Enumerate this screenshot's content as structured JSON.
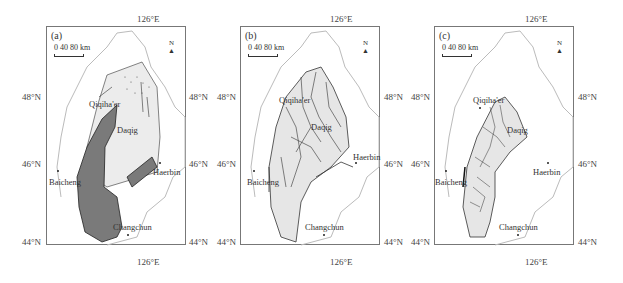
{
  "figure": {
    "panels": [
      {
        "id": "a",
        "label": "(a)"
      },
      {
        "id": "b",
        "label": "(b)"
      },
      {
        "id": "c",
        "label": "(c)"
      }
    ],
    "scale_label": "0  40  80 km",
    "north_label": "N",
    "axes": {
      "top_lon": "126°E",
      "bottom_lon": "126°E",
      "lat_48": "48°N",
      "lat_46": "46°N",
      "lat_44": "44°N"
    },
    "cities": {
      "a": {
        "qiqihaer": "Qiqiha'er",
        "daqing": "Daqig",
        "baicheng": "Baicheng",
        "haerbin": "Haerbin",
        "changchun": "Changchun"
      },
      "b": {
        "qiqihaer": "Qiqiha'er",
        "daqing": "Daqig",
        "baicheng": "Baicheng",
        "haerbin": "Haerbin",
        "changchun": "Changchun"
      },
      "c": {
        "qiqihaer": "Qiqiha'er",
        "daqing": "Daqig",
        "baicheng": "Baicheng",
        "haerbin": "Haerbin",
        "changchun": "Changchun"
      }
    },
    "colors": {
      "frame": "#777777",
      "boundary": "#bbbbbb",
      "basin_fill": "#e6e6e6",
      "dark_fill": "#7a7a7a",
      "line": "#333333"
    }
  }
}
